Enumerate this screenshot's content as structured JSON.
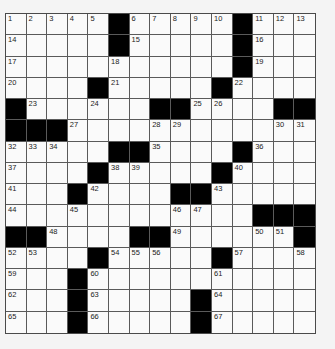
{
  "puzzle": {
    "rows": 15,
    "cols": 15,
    "colors": {
      "cell": "#fafafa",
      "block": "#000000",
      "line": "#5a5a5a",
      "background": "#f4f4f4"
    },
    "layout": [
      ".....#.....#...",
      ".....#.....#...",
      "...........#...",
      "....#.....#....",
      "#......##....##",
      "###............",
      ".....##....#...",
      "....#.....#....",
      "...#....##.....",
      "............###",
      "##....##......#",
      "....#.....#....",
      "...#...........",
      "...#.....#.....",
      "...#.....#....."
    ],
    "numbers": [
      {
        "r": 0,
        "c": 0,
        "n": "1"
      },
      {
        "r": 0,
        "c": 1,
        "n": "2"
      },
      {
        "r": 0,
        "c": 2,
        "n": "3"
      },
      {
        "r": 0,
        "c": 3,
        "n": "4"
      },
      {
        "r": 0,
        "c": 4,
        "n": "5"
      },
      {
        "r": 0,
        "c": 6,
        "n": "6"
      },
      {
        "r": 0,
        "c": 7,
        "n": "7"
      },
      {
        "r": 0,
        "c": 8,
        "n": "8"
      },
      {
        "r": 0,
        "c": 9,
        "n": "9"
      },
      {
        "r": 0,
        "c": 10,
        "n": "10"
      },
      {
        "r": 0,
        "c": 12,
        "n": "11"
      },
      {
        "r": 0,
        "c": 13,
        "n": "12"
      },
      {
        "r": 0,
        "c": 14,
        "n": "13"
      },
      {
        "r": 1,
        "c": 0,
        "n": "14"
      },
      {
        "r": 1,
        "c": 6,
        "n": "15"
      },
      {
        "r": 1,
        "c": 12,
        "n": "16"
      },
      {
        "r": 2,
        "c": 0,
        "n": "17"
      },
      {
        "r": 2,
        "c": 5,
        "n": "18"
      },
      {
        "r": 2,
        "c": 12,
        "n": "19"
      },
      {
        "r": 3,
        "c": 0,
        "n": "20"
      },
      {
        "r": 3,
        "c": 5,
        "n": "21"
      },
      {
        "r": 3,
        "c": 11,
        "n": "22"
      },
      {
        "r": 4,
        "c": 1,
        "n": "23"
      },
      {
        "r": 4,
        "c": 4,
        "n": "24"
      },
      {
        "r": 4,
        "c": 9,
        "n": "25"
      },
      {
        "r": 4,
        "c": 10,
        "n": "26"
      },
      {
        "r": 5,
        "c": 3,
        "n": "27"
      },
      {
        "r": 5,
        "c": 7,
        "n": "28"
      },
      {
        "r": 5,
        "c": 8,
        "n": "29"
      },
      {
        "r": 5,
        "c": 13,
        "n": "30"
      },
      {
        "r": 5,
        "c": 14,
        "n": "31"
      },
      {
        "r": 6,
        "c": 0,
        "n": "32"
      },
      {
        "r": 6,
        "c": 1,
        "n": "33"
      },
      {
        "r": 6,
        "c": 2,
        "n": "34"
      },
      {
        "r": 6,
        "c": 7,
        "n": "35"
      },
      {
        "r": 6,
        "c": 12,
        "n": "36"
      },
      {
        "r": 7,
        "c": 0,
        "n": "37"
      },
      {
        "r": 7,
        "c": 5,
        "n": "38"
      },
      {
        "r": 7,
        "c": 6,
        "n": "39"
      },
      {
        "r": 7,
        "c": 11,
        "n": "40"
      },
      {
        "r": 8,
        "c": 0,
        "n": "41"
      },
      {
        "r": 8,
        "c": 4,
        "n": "42"
      },
      {
        "r": 8,
        "c": 10,
        "n": "43"
      },
      {
        "r": 9,
        "c": 0,
        "n": "44"
      },
      {
        "r": 9,
        "c": 3,
        "n": "45"
      },
      {
        "r": 9,
        "c": 8,
        "n": "46"
      },
      {
        "r": 9,
        "c": 9,
        "n": "47"
      },
      {
        "r": 10,
        "c": 2,
        "n": "48"
      },
      {
        "r": 10,
        "c": 8,
        "n": "49"
      },
      {
        "r": 10,
        "c": 12,
        "n": "50"
      },
      {
        "r": 10,
        "c": 13,
        "n": "51"
      },
      {
        "r": 11,
        "c": 0,
        "n": "52"
      },
      {
        "r": 11,
        "c": 1,
        "n": "53"
      },
      {
        "r": 11,
        "c": 5,
        "n": "54"
      },
      {
        "r": 11,
        "c": 6,
        "n": "55"
      },
      {
        "r": 11,
        "c": 7,
        "n": "56"
      },
      {
        "r": 11,
        "c": 11,
        "n": "57"
      },
      {
        "r": 11,
        "c": 14,
        "n": "58"
      },
      {
        "r": 12,
        "c": 0,
        "n": "59"
      },
      {
        "r": 12,
        "c": 4,
        "n": "60"
      },
      {
        "r": 12,
        "c": 10,
        "n": "61"
      },
      {
        "r": 13,
        "c": 0,
        "n": "62"
      },
      {
        "r": 13,
        "c": 4,
        "n": "63"
      },
      {
        "r": 13,
        "c": 10,
        "n": "64"
      },
      {
        "r": 14,
        "c": 0,
        "n": "65"
      },
      {
        "r": 14,
        "c": 4,
        "n": "66"
      },
      {
        "r": 14,
        "c": 10,
        "n": "67"
      }
    ]
  }
}
